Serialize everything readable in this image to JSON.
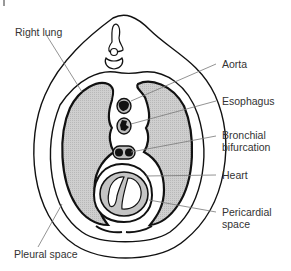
{
  "diagram": {
    "type": "anatomical cross-section of thorax",
    "colors": {
      "lung_fill": "#c8c8c8",
      "outline": "#111111",
      "leader_line": "#777777",
      "text": "#333333"
    },
    "labels": {
      "right_lung": "Right lung",
      "aorta": "Aorta",
      "esophagus": "Esophagus",
      "bronchial_1": "Bronchial",
      "bronchial_2": "bifurcation",
      "heart": "Heart",
      "pericardial_1": "Pericardial",
      "pericardial_2": "space",
      "pleural_space": "Pleural space"
    }
  }
}
